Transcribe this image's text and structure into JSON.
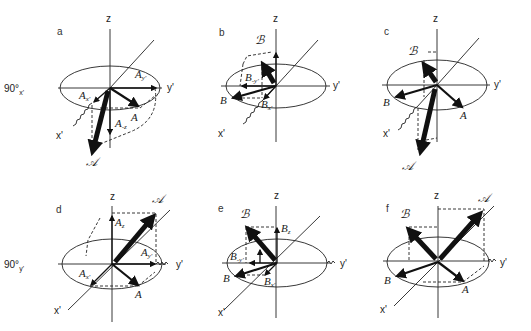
{
  "figure": {
    "panels": [
      {
        "id": "a",
        "letter": "a",
        "pulse_label": "90°",
        "pulse_sub": "x'",
        "axes": {
          "z": "z",
          "y": "y'",
          "x": "x'"
        },
        "vectors": {
          "big": "𝒜",
          "small": "A",
          "comp_y": "A",
          "comp_y_sub": "y'",
          "comp_x": "A",
          "comp_x_sub": "x'",
          "comp_z": "A",
          "comp_z_sub": "-z"
        }
      },
      {
        "id": "b",
        "letter": "b",
        "axes": {
          "z": "z",
          "y": "y'",
          "x": "x'"
        },
        "vectors": {
          "big": "ℬ",
          "small": "B",
          "comp_y": "B",
          "comp_y_sub": "-y'",
          "comp_x": "B",
          "comp_x_sub": "x'"
        }
      },
      {
        "id": "c",
        "letter": "c",
        "axes": {
          "z": "z",
          "y": "y'",
          "x": "x'"
        },
        "vectors": {
          "big1": "ℬ",
          "big2": "𝒜",
          "small1": "B",
          "small2": "A"
        }
      },
      {
        "id": "d",
        "letter": "d",
        "pulse_label": "90°",
        "pulse_sub": "y'",
        "axes": {
          "z": "z",
          "y": "y'",
          "x": "x'"
        },
        "vectors": {
          "big": "𝒜",
          "small": "A",
          "comp_z": "A",
          "comp_z_sub": "z",
          "comp_y": "A",
          "comp_y_sub": "y'",
          "comp_x": "A",
          "comp_x_sub": "x'"
        }
      },
      {
        "id": "e",
        "letter": "e",
        "axes": {
          "z": "z",
          "y": "y'",
          "x": "x'"
        },
        "vectors": {
          "big": "ℬ",
          "small": "B",
          "comp_z": "B",
          "comp_z_sub": "z",
          "comp_y": "B",
          "comp_y_sub": "-y'",
          "comp_x": "B",
          "comp_x_sub": "x'"
        }
      },
      {
        "id": "f",
        "letter": "f",
        "axes": {
          "z": "z",
          "y": "y'",
          "x": "x'"
        },
        "vectors": {
          "big1": "ℬ",
          "big2": "𝒜",
          "small1": "B",
          "small2": "A"
        }
      }
    ]
  }
}
